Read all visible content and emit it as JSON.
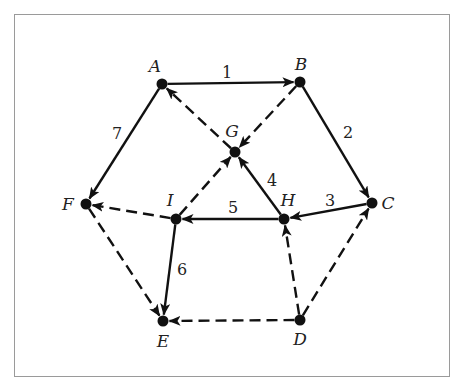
{
  "diagram": {
    "type": "directed-graph",
    "colors": {
      "ink": "#111111",
      "frame": "#9a9a9a",
      "background": "#ffffff"
    },
    "nodes": [
      {
        "id": "A",
        "label": "A",
        "x": 162,
        "y": 84,
        "lx": 155,
        "ly": 72
      },
      {
        "id": "B",
        "label": "B",
        "x": 300,
        "y": 82,
        "lx": 301,
        "ly": 70
      },
      {
        "id": "C",
        "label": "C",
        "x": 372,
        "y": 203,
        "lx": 388,
        "ly": 209
      },
      {
        "id": "D",
        "label": "D",
        "x": 300,
        "y": 320,
        "lx": 300,
        "ly": 345
      },
      {
        "id": "E",
        "label": "E",
        "x": 163,
        "y": 321,
        "lx": 163,
        "ly": 347
      },
      {
        "id": "F",
        "label": "F",
        "x": 86,
        "y": 204,
        "lx": 68,
        "ly": 210
      },
      {
        "id": "G",
        "label": "G",
        "x": 235,
        "y": 152,
        "lx": 232,
        "ly": 137
      },
      {
        "id": "H",
        "label": "H",
        "x": 284,
        "y": 219,
        "lx": 288,
        "ly": 206
      },
      {
        "id": "I",
        "label": "I",
        "x": 176,
        "y": 219,
        "lx": 170,
        "ly": 206
      }
    ],
    "edges": [
      {
        "from": "A",
        "to": "B",
        "style": "solid",
        "label": "1",
        "lx": 227,
        "ly": 78
      },
      {
        "from": "B",
        "to": "C",
        "style": "solid",
        "label": "2",
        "lx": 348,
        "ly": 138
      },
      {
        "from": "C",
        "to": "H",
        "style": "solid",
        "label": "3",
        "lx": 330,
        "ly": 206
      },
      {
        "from": "H",
        "to": "G",
        "style": "solid",
        "label": "4",
        "lx": 272,
        "ly": 186
      },
      {
        "from": "H",
        "to": "I",
        "style": "solid",
        "label": "5",
        "lx": 233,
        "ly": 213
      },
      {
        "from": "I",
        "to": "E",
        "style": "solid",
        "label": "6",
        "lx": 182,
        "ly": 275
      },
      {
        "from": "A",
        "to": "F",
        "style": "solid",
        "label": "7",
        "lx": 117,
        "ly": 139
      },
      {
        "from": "B",
        "to": "G",
        "style": "dashed",
        "label": ""
      },
      {
        "from": "G",
        "to": "A",
        "style": "dashed",
        "label": ""
      },
      {
        "from": "I",
        "to": "G",
        "style": "dashed",
        "label": ""
      },
      {
        "from": "I",
        "to": "F",
        "style": "dashed",
        "label": ""
      },
      {
        "from": "F",
        "to": "E",
        "style": "dashed",
        "label": ""
      },
      {
        "from": "D",
        "to": "E",
        "style": "dashed",
        "label": ""
      },
      {
        "from": "D",
        "to": "H",
        "style": "dashed",
        "label": ""
      },
      {
        "from": "D",
        "to": "C",
        "style": "dashed",
        "label": ""
      }
    ]
  }
}
